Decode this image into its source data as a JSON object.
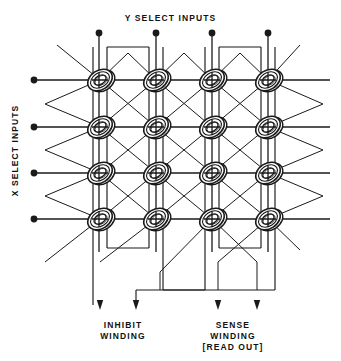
{
  "diagram": {
    "title_top": "Y SELECT INPUTS",
    "title_left": "X SELECT INPUTS",
    "label_inhibit": "INHIBIT\nWINDING",
    "label_sense": "SENSE\nWINDING\n[READ OUT]",
    "label_inhibit_line1": "INHIBIT",
    "label_inhibit_line2": "WINDING",
    "label_sense_line1": "SENSE",
    "label_sense_line2": "WINDING",
    "label_sense_line3": "[READ OUT]",
    "type": "magnetic-core-memory-plane",
    "grid": {
      "rows": 4,
      "columns": 4,
      "core_count": 16
    },
    "colors": {
      "line": "#1a1a1a",
      "core_fill": "#ffffff",
      "background": "#ffffff"
    },
    "core_x_positions": [
      100,
      156,
      212,
      268
    ],
    "core_y_positions": [
      80,
      127,
      173,
      219
    ],
    "y_input_terminals": [
      {
        "x": 99,
        "y": 33
      },
      {
        "x": 156,
        "y": 33
      },
      {
        "x": 212,
        "y": 33
      },
      {
        "x": 268,
        "y": 33
      }
    ],
    "x_input_terminals": [
      {
        "x": 33,
        "y": 80
      },
      {
        "x": 33,
        "y": 127
      },
      {
        "x": 33,
        "y": 173
      },
      {
        "x": 33,
        "y": 219
      }
    ],
    "output_arrows": [
      {
        "x": 100,
        "y": 305,
        "winding": "inhibit"
      },
      {
        "x": 136,
        "y": 305,
        "winding": "inhibit"
      },
      {
        "x": 218,
        "y": 305,
        "winding": "sense"
      },
      {
        "x": 257,
        "y": 305,
        "winding": "sense"
      }
    ]
  }
}
